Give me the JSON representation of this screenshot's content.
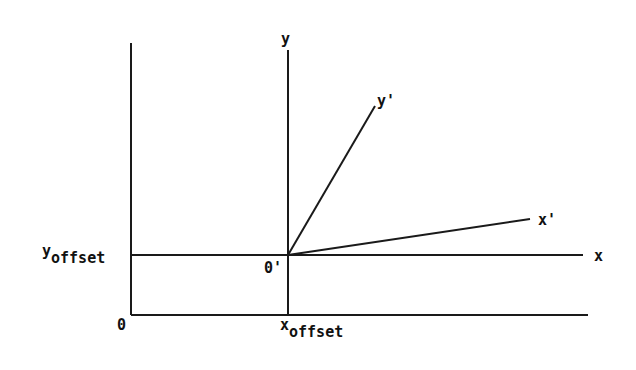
{
  "diagram": {
    "type": "coordinate-transform",
    "line_color": "#1a1a1a",
    "labels": {
      "y_axis": "y",
      "x_axis": "x",
      "y_prime": "y'",
      "x_prime": "x'",
      "origin": "0",
      "origin_prime": "0'",
      "x_offset_base": "x",
      "x_offset_sub": "offset",
      "y_offset_base": "y",
      "y_offset_sub": "offset"
    },
    "lines": [
      {
        "name": "outer-y-axis",
        "x1": 131,
        "y1": 43,
        "x2": 131,
        "y2": 315
      },
      {
        "name": "outer-x-axis",
        "x1": 131,
        "y1": 315,
        "x2": 588,
        "y2": 315
      },
      {
        "name": "inner-y-axis",
        "x1": 288,
        "y1": 50,
        "x2": 288,
        "y2": 315
      },
      {
        "name": "inner-x-axis",
        "x1": 131,
        "y1": 255,
        "x2": 583,
        "y2": 255
      },
      {
        "name": "rotated-y-prime-axis",
        "x1": 288,
        "y1": 255,
        "x2": 375,
        "y2": 106
      },
      {
        "name": "rotated-x-prime-axis",
        "x1": 288,
        "y1": 255,
        "x2": 530,
        "y2": 219
      }
    ]
  }
}
